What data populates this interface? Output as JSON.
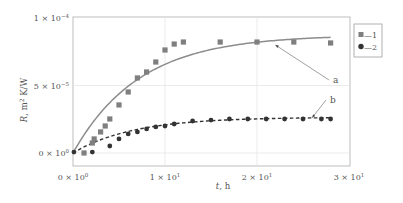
{
  "chart_data": {
    "type": "scatter",
    "title": "",
    "xlabel": "t, h",
    "ylabel": "R, m² K/W",
    "xlim": [
      0,
      30
    ],
    "ylim": [
      0,
      0.0001
    ],
    "grid": true,
    "x_ticks": [
      {
        "value": 0,
        "mantissa": "0 × 10",
        "exp": "0"
      },
      {
        "value": 10,
        "mantissa": "1 × 10",
        "exp": "1"
      },
      {
        "value": 20,
        "mantissa": "2 × 10",
        "exp": "1"
      },
      {
        "value": 30,
        "mantissa": "3 × 10",
        "exp": "1"
      }
    ],
    "y_ticks": [
      {
        "value": 0,
        "mantissa": "0 × 10",
        "exp": "0"
      },
      {
        "value": 5e-05,
        "mantissa": "5 × 10",
        "exp": "−5"
      },
      {
        "value": 0.0001,
        "mantissa": "1 × 10",
        "exp": "−4"
      }
    ],
    "legend_position": "right",
    "series": [
      {
        "name": "1",
        "legend_label": "—1",
        "marker": "square",
        "color": "#7f7f7f",
        "points": [
          [
            1.2,
            0.0
          ],
          [
            2.1,
            7.4e-06
          ],
          [
            2.3,
            1.04e-05
          ],
          [
            3.0,
            1.56e-05
          ],
          [
            3.5,
            2e-05
          ],
          [
            4.0,
            2.52e-05
          ],
          [
            5.0,
            3.56e-05
          ],
          [
            6.0,
            4.52e-05
          ],
          [
            7.0,
            5.56e-05
          ],
          [
            8.0,
            6e-05
          ],
          [
            9.0,
            6.74e-05
          ],
          [
            10.0,
            7.63e-05
          ],
          [
            11.0,
            8.07e-05
          ],
          [
            12.0,
            8.22e-05
          ],
          [
            16.0,
            8.22e-05
          ],
          [
            20.0,
            8.22e-05
          ],
          [
            24.0,
            8.22e-05
          ],
          [
            28.0,
            8.15e-05
          ]
        ],
        "fit": {
          "style": "solid",
          "color": "#8c8c8c",
          "model": "R = 0.0000875 * (1 - exp(-t/7.2))",
          "R_inf": 8.75e-05,
          "tau": 7.2,
          "t_range": [
            0,
            28
          ]
        }
      },
      {
        "name": "2",
        "legend_label": "—2",
        "marker": "circle",
        "color": "#333333",
        "points": [
          [
            0.1,
            7e-07
          ],
          [
            2.1,
            7e-07
          ],
          [
            4.0,
            5.2e-06
          ],
          [
            5.0,
            1.04e-05
          ],
          [
            6.0,
            1.41e-05
          ],
          [
            7.0,
            1.56e-05
          ],
          [
            8.0,
            1.78e-05
          ],
          [
            9.0,
            1.93e-05
          ],
          [
            10.0,
            2e-05
          ],
          [
            11.0,
            2.15e-05
          ],
          [
            13.0,
            2.37e-05
          ],
          [
            15.0,
            2.44e-05
          ],
          [
            17.0,
            2.52e-05
          ],
          [
            19.0,
            2.52e-05
          ],
          [
            21.0,
            2.52e-05
          ],
          [
            23.0,
            2.52e-05
          ],
          [
            25.0,
            2.52e-05
          ],
          [
            27.0,
            2.52e-05
          ],
          [
            28.0,
            2.52e-05
          ]
        ],
        "fit": {
          "style": "dashed",
          "color": "#333333",
          "model": "R = 0.0000265 * (1 - exp(-t/6.5))",
          "R_inf": 2.65e-05,
          "tau": 6.5,
          "t_range": [
            0,
            28
          ]
        }
      }
    ],
    "annotations": [
      {
        "label": "a",
        "points_to_series": "1",
        "target": [
          22.0,
          8e-05
        ]
      },
      {
        "label": "b",
        "points_to_series": "2",
        "target": [
          26.0,
          2.62e-05
        ]
      }
    ]
  }
}
